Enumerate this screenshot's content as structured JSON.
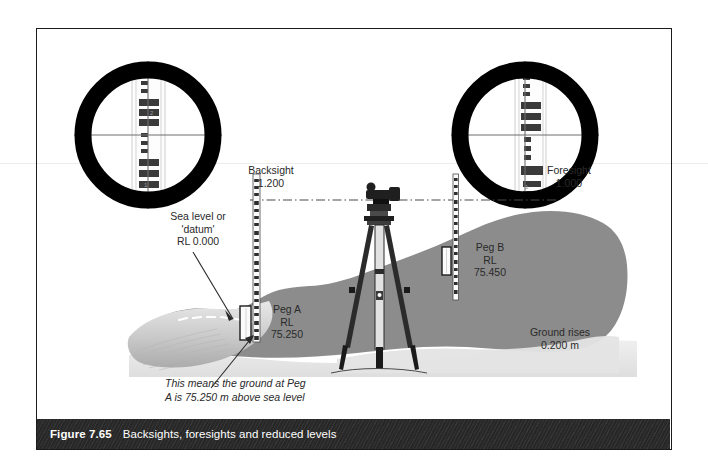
{
  "figure": {
    "number": "Figure 7.65",
    "caption": "Backsights, foresights and reduced levels"
  },
  "telescope_views": [
    {
      "name": "backsight-view",
      "label": "Backsight",
      "reading": "1.200"
    },
    {
      "name": "foresight-view",
      "label": "Foresight",
      "reading": "1.000"
    }
  ],
  "annotations": {
    "sea_level": {
      "line1": "Sea level or",
      "line2": "'datum'",
      "line3": "RL 0.000"
    },
    "peg_a": {
      "line1": "Peg A",
      "line2": "RL",
      "line3": "75.250"
    },
    "peg_b": {
      "line1": "Peg B",
      "line2": "RL",
      "line3": "75.450"
    },
    "ground_rise": {
      "line1": "Ground rises",
      "line2": "0.200 m"
    },
    "note": {
      "line1": "This means the ground at Peg",
      "line2": "A is 75.250 m above sea level"
    }
  },
  "colors": {
    "frame": "#1b1b1b",
    "caption_bar": "#2b2b2b",
    "caption_text": "#ffffff",
    "ground": "#8c8c8c",
    "ground_light": "#d9d9d9",
    "sea": "#bfbfbf",
    "ink": "#2a2a2a"
  }
}
